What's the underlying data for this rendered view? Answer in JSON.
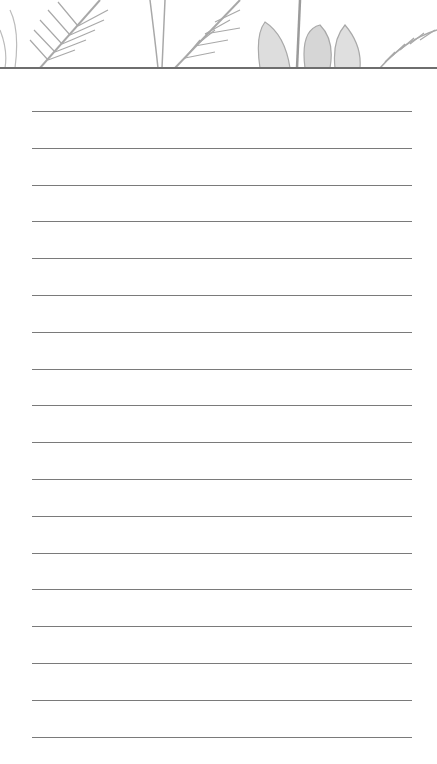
{
  "page": {
    "type": "lined notepad page",
    "header": {
      "decoration": "grayscale tropical leaves illustration"
    },
    "colors": {
      "background": "#ffffff",
      "line": "#7a7a7a",
      "leaf": "#9a9a9a",
      "header_rule": "#6e6e6e"
    },
    "lines": {
      "count": 18,
      "first_y": 111,
      "spacing": 36.8,
      "x_start": 32,
      "x_end": 412
    }
  }
}
